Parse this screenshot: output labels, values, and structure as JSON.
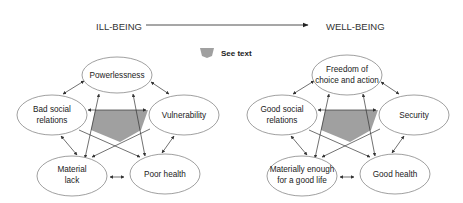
{
  "header": {
    "left_label": "ILL-BEING",
    "right_label": "WELL-BEING",
    "arrow": "right-arrow"
  },
  "legend": {
    "label": "See text",
    "swatch_color": "#a0a0a0"
  },
  "colors": {
    "pentagon_fill": "#a0a0a0",
    "ellipse_stroke": "#777777",
    "arrow_stroke": "#333333"
  },
  "ill_being": {
    "top": [
      "Powerlessness"
    ],
    "left": [
      "Bad social",
      "relations"
    ],
    "right": [
      "Vulnerability"
    ],
    "bottom_left": [
      "Material",
      "lack"
    ],
    "bottom_right": [
      "Poor health"
    ]
  },
  "well_being": {
    "top": [
      "Freedom of",
      "choice and action"
    ],
    "left": [
      "Good social",
      "relations"
    ],
    "right": [
      "Security"
    ],
    "bottom_left": [
      "Materially enough",
      "for a good life"
    ],
    "bottom_right": [
      "Good health"
    ]
  }
}
